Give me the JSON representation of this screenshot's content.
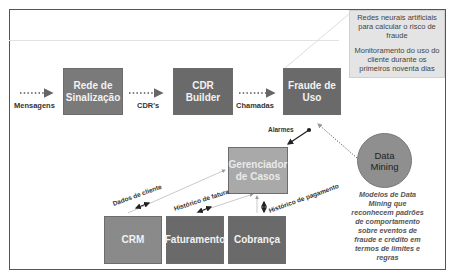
{
  "diagram": {
    "nodes": {
      "rede": {
        "label": "Rede de Sinalização"
      },
      "cdr_builder": {
        "label": "CDR Builder"
      },
      "fraude": {
        "label": "Fraude de Uso"
      },
      "gerenciador": {
        "label": "Gerenciador de Casos"
      },
      "crm": {
        "label": "CRM"
      },
      "faturamento": {
        "label": "Faturamento"
      },
      "cobranca": {
        "label": "Cobrança"
      },
      "data_mining": {
        "label": "Data Mining"
      }
    },
    "edges": {
      "mensagens": "Mensagens",
      "cdrs": "CDR's",
      "chamadas": "Chamadas",
      "alarmes": "Alarmes",
      "dados_cliente": "Dados de cliente",
      "historico_fatura": "Histórico de fatura",
      "historico_pagamento": "Histórico de pagamento"
    },
    "notes": {
      "fraude_note_1": "Redes neurais artificiais para calcular o risco de fraude",
      "fraude_note_2": "Monitoramento do uso do cliente durante os primeiros noventa dias",
      "data_mining_note": "Modelos de Data Mining que reconhecem padrões de comportamento sobre eventos de fraude e crédito em termos de limites e regras"
    }
  }
}
